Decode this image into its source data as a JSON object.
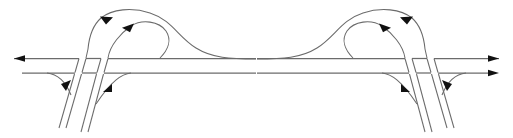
{
  "figure": {
    "title": "Highway interchange ramp flow diagram",
    "canvas": {
      "width": 513,
      "height": 138
    },
    "stroke_color": "#6b6b6b",
    "arrow_color": "#111111",
    "background_color": "#ffffff"
  },
  "panels": [
    {
      "id": "left-panel",
      "label": "Left interchange diagram",
      "mirrored": false,
      "origin_x": 0,
      "roadways": [
        {
          "id": "upper-carriageway",
          "label": "Upper carriageway (westbound)",
          "direction": "leftward",
          "y": 58.5,
          "x_start": 14,
          "x_end": 256,
          "arrowhead": {
            "x": 16,
            "y": 58.5,
            "points": "left"
          }
        },
        {
          "id": "lower-carriageway",
          "label": "Lower carriageway (eastbound)",
          "direction": "rightward",
          "y": 73,
          "x_start": 22,
          "x_end": 256,
          "arrowhead": null
        }
      ],
      "ramps": [
        {
          "id": "outer-loop-ramp",
          "label": "Outer loop ramp",
          "direction": "leftward-over-top",
          "arrowhead": {
            "x": 106,
            "y": 18,
            "points": "left"
          }
        },
        {
          "id": "inner-loop-ramp",
          "label": "Inner loop ramp",
          "direction": "rightward-around-loop",
          "arrowhead": {
            "x": 128,
            "y": 27.5,
            "points": "right"
          }
        },
        {
          "id": "diagonal-ramp-outer",
          "label": "Outer diagonal crossing ramp",
          "direction": "descending-south"
        },
        {
          "id": "diagonal-ramp-inner",
          "label": "Inner diagonal crossing ramp",
          "direction": "descending-south"
        },
        {
          "id": "offramp-curve-left",
          "label": "Left exit ramp curve",
          "direction": "down-left",
          "arrowhead": {
            "x": 68,
            "y": 88,
            "points": "down-left"
          }
        },
        {
          "id": "onramp-curve-right",
          "label": "Right entry ramp curve",
          "direction": "up-right",
          "arrowhead": {
            "x": 110,
            "y": 88,
            "points": "up-right"
          }
        }
      ]
    },
    {
      "id": "right-panel",
      "label": "Right interchange diagram (mirrored)",
      "mirrored": true,
      "origin_x": 257,
      "roadways": [
        {
          "id": "upper-carriageway",
          "label": "Upper carriageway (westbound)",
          "direction": "leftward",
          "y": 58.5,
          "x_start": 257,
          "x_end": 499,
          "arrowhead": {
            "x": 269,
            "y": 58.5,
            "points": "left"
          }
        },
        {
          "id": "lower-carriageway",
          "label": "Lower carriageway (eastbound)",
          "direction": "rightward",
          "y": 73,
          "x_start": 257,
          "x_end": 497,
          "arrowhead": {
            "x": 497,
            "y": 73,
            "points": "right"
          }
        }
      ],
      "ramps": [
        {
          "id": "outer-loop-ramp",
          "label": "Outer loop ramp",
          "direction": "rightward-over-top",
          "arrowhead": {
            "x": 407,
            "y": 18,
            "points": "right"
          }
        },
        {
          "id": "inner-loop-ramp",
          "label": "Inner loop ramp",
          "direction": "leftward-around-loop",
          "arrowhead": {
            "x": 385,
            "y": 27.5,
            "points": "left"
          }
        },
        {
          "id": "diagonal-ramp-outer",
          "label": "Outer diagonal crossing ramp",
          "direction": "descending-south"
        },
        {
          "id": "diagonal-ramp-inner",
          "label": "Inner diagonal crossing ramp",
          "direction": "descending-south"
        },
        {
          "id": "offramp-curve-left",
          "label": "Left exit ramp curve",
          "direction": "down-right",
          "arrowhead": {
            "x": 403,
            "y": 88,
            "points": "down-right"
          }
        },
        {
          "id": "onramp-curve-right",
          "label": "Right entry ramp curve",
          "direction": "up-left",
          "arrowhead": {
            "x": 445,
            "y": 88,
            "points": "up-left"
          }
        }
      ]
    }
  ]
}
